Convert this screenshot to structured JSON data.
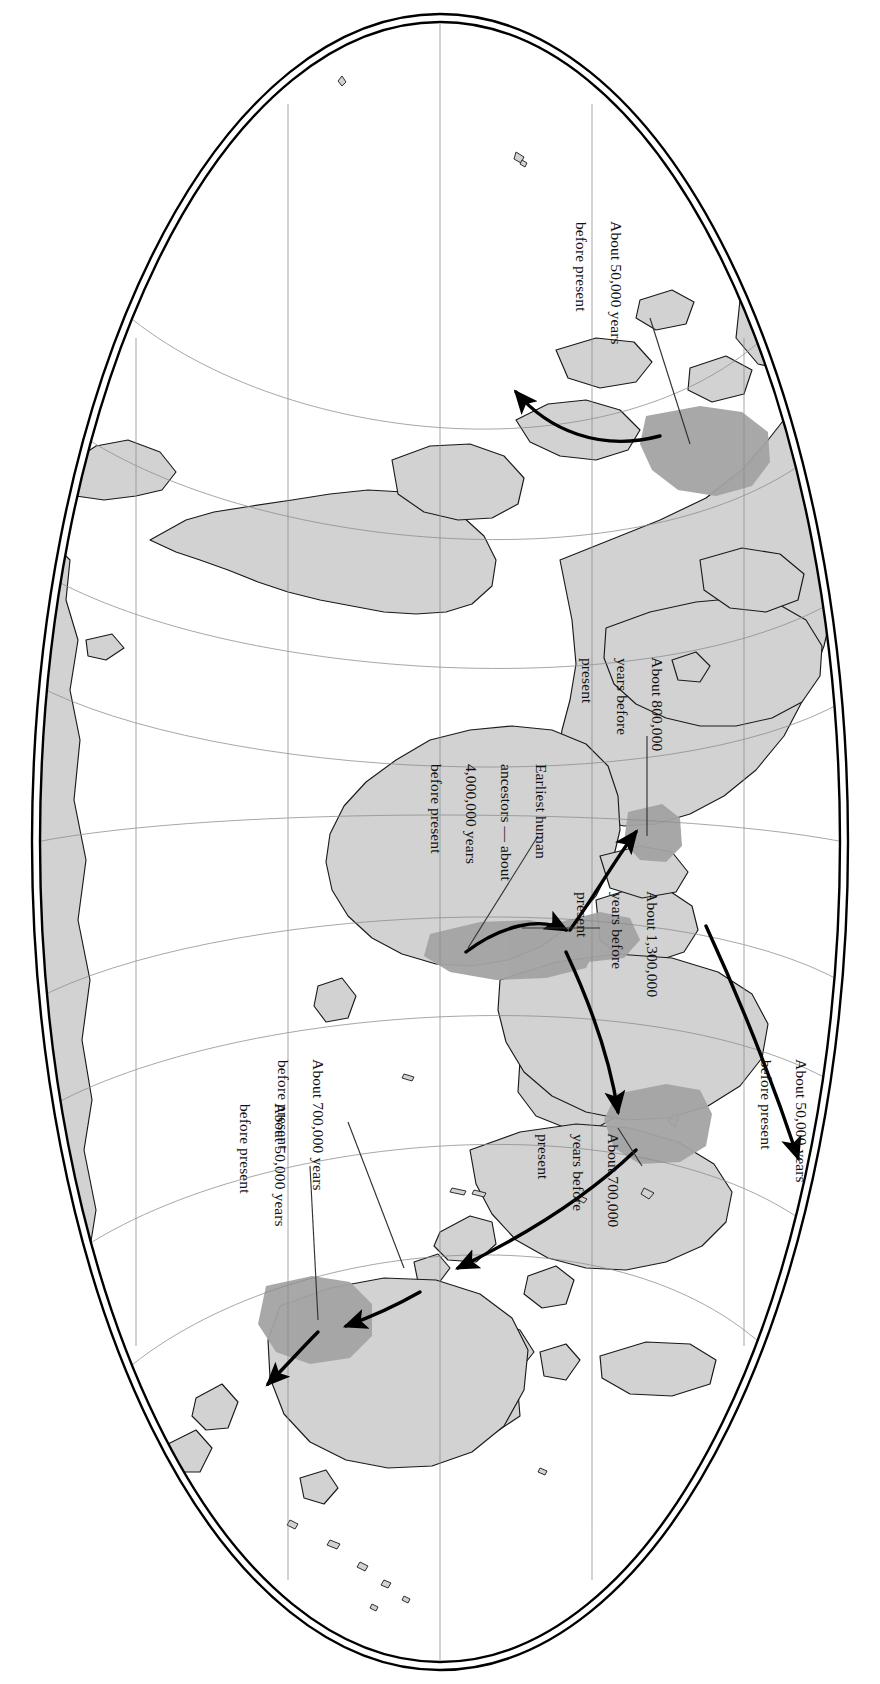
{
  "map": {
    "title": "Early human migration world map",
    "projection": "elliptical (Mollweide-style) world projection, rotated 90 degrees",
    "orientation_note": "Entire map and all labels are rotated 90° (text reads top-to-bottom)",
    "colors": {
      "background": "#ffffff",
      "land_fill": "#d2d2d2",
      "land_stroke": "#1a1a1a",
      "origin_region_fill": "#a3a3a3",
      "graticule": "#8d8d8d",
      "border": "#000000",
      "arrow": "#000000",
      "leader_line": "#333333",
      "text": "#111111"
    },
    "border": {
      "style": "double-line ellipse",
      "outer_label": "outer-ellipse",
      "inner_label": "inner-ellipse"
    },
    "graticule": {
      "meridians": 5,
      "parallels": 7,
      "grid": true
    }
  },
  "labels": [
    {
      "id": "siberia-beringia",
      "name": "label-50000-beringia",
      "lines": [
        "About 50,000 years",
        "before present"
      ],
      "text": "About 50,000 years before present",
      "value": 50000,
      "unit": "years before present",
      "points_to": "Northeast Asia / Beringia shaded region"
    },
    {
      "id": "europe-800k",
      "name": "label-800000-europe",
      "lines": [
        "About 800,000",
        "years before",
        "present"
      ],
      "text": "About 800,000 years before present",
      "value": 800000,
      "unit": "years before present",
      "points_to": "Europe shaded region"
    },
    {
      "id": "earliest-ancestors",
      "name": "label-earliest-human-ancestors",
      "lines": [
        "Earliest human",
        "ancestors — about",
        "4,000,000 years",
        "before present"
      ],
      "text": "Earliest human ancestors — about 4,000,000 years before present",
      "value": 4000000,
      "unit": "years before present",
      "points_to": "East Africa origin region"
    },
    {
      "id": "near-east-1300k",
      "name": "label-1300000-near-east",
      "lines": [
        "About 1,300,000",
        "years before",
        "present"
      ],
      "text": "About 1,300,000 years before present",
      "value": 1300000,
      "unit": "years before present",
      "points_to": "Near East / Middle East shaded region"
    },
    {
      "id": "east-asia-700k",
      "name": "label-700000-east-asia",
      "lines": [
        "About 700,000",
        "years before",
        "present"
      ],
      "text": "About 700,000 years before present",
      "value": 700000,
      "unit": "years before present",
      "points_to": "East Asia shaded region"
    },
    {
      "id": "europe-50k",
      "name": "label-50000-europe",
      "lines": [
        "About 50,000 years",
        "before present"
      ],
      "text": "About 50,000 years before present",
      "value": 50000,
      "unit": "years before present",
      "points_to": "Western Europe"
    },
    {
      "id": "sea-700k",
      "name": "label-700000-southeast-asia",
      "lines": [
        "About 700,000 years",
        "before present"
      ],
      "text": "About 700,000 years before present",
      "value": 700000,
      "unit": "years before present",
      "points_to": "Island Southeast Asia / Java"
    },
    {
      "id": "australia-50k",
      "name": "label-50000-australia",
      "lines": [
        "About 50,000 years",
        "before present"
      ],
      "text": "About 50,000 years before present",
      "value": 50000,
      "unit": "years before present",
      "points_to": "Australia shaded region"
    }
  ],
  "migration_arrows": [
    {
      "name": "arrow-africa-to-near-east",
      "from": "East Africa",
      "to": "Near East"
    },
    {
      "name": "arrow-near-east-to-europe",
      "from": "Near East",
      "to": "Europe"
    },
    {
      "name": "arrow-near-east-to-east-asia",
      "from": "Near East",
      "to": "East Asia"
    },
    {
      "name": "arrow-east-asia-to-southeast-asia",
      "from": "East Asia",
      "to": "Island Southeast Asia"
    },
    {
      "name": "arrow-southeast-asia-to-australia",
      "from": "Island Southeast Asia",
      "to": "Australia"
    },
    {
      "name": "arrow-australia-inland",
      "from": "Northern Australia",
      "to": "Southern Australia"
    },
    {
      "name": "arrow-europe-westward",
      "from": "Near East",
      "to": "Western Europe"
    },
    {
      "name": "arrow-asia-to-beringia",
      "from": "Northeast Asia",
      "to": "Beringia / North America"
    }
  ],
  "shaded_regions": [
    {
      "name": "region-east-africa",
      "label": "Earliest human ancestors origin"
    },
    {
      "name": "region-near-east",
      "label": "Near East settlement"
    },
    {
      "name": "region-europe",
      "label": "Europe settlement"
    },
    {
      "name": "region-east-asia",
      "label": "East Asia settlement"
    },
    {
      "name": "region-australia",
      "label": "Australia settlement"
    },
    {
      "name": "region-beringia",
      "label": "Northeast Asia / Beringia settlement"
    }
  ]
}
